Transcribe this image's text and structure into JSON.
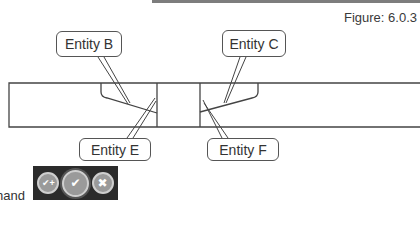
{
  "figure": {
    "label": "Figure: 6.0.3"
  },
  "callouts": {
    "b": "Entity B",
    "c": "Entity C",
    "e": "Entity E",
    "f": "Entity F"
  },
  "partial_text": "hand",
  "toolbar": {
    "buttons": [
      {
        "name": "ok-and-continue",
        "glyph": "✔+"
      },
      {
        "name": "ok",
        "glyph": "✔"
      },
      {
        "name": "cancel",
        "glyph": "✖"
      }
    ]
  },
  "colors": {
    "line": "#444444",
    "toolbar_bg": "#2b2b2b",
    "button_fill": "#9a9a9a"
  }
}
